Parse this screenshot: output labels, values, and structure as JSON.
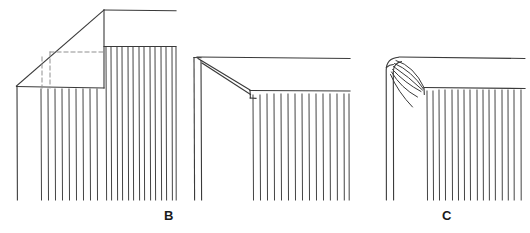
{
  "plate": {
    "title": "Curtain heading corner treatments",
    "background_color": "#ffffff",
    "line_color": "#3a3a3a",
    "dash_color": "#8c8c8c",
    "width": 530,
    "height": 233
  },
  "labels": [
    {
      "id": "b",
      "text": "B",
      "x": 164,
      "y": 209
    },
    {
      "id": "c",
      "text": "C",
      "x": 442,
      "y": 209
    }
  ],
  "figures": [
    {
      "id": "a",
      "name": "mitred-corner-with-hidden-construction",
      "label": null,
      "description": "Corner with straight diagonal return, dashed hidden lines showing inner fold, and vertical gathered fabric hatching below.",
      "parts": {
        "top_rail": {
          "from": [
            104,
            10
          ],
          "to": [
            176,
            11
          ]
        },
        "diagonal": {
          "from": [
            16,
            86
          ],
          "to": [
            104,
            10
          ]
        },
        "vertical_post_right": {
          "from": [
            104,
            10
          ],
          "to": [
            104,
            88
          ]
        },
        "bottom_ledge": {
          "from": [
            16,
            86
          ],
          "to": [
            104,
            88
          ]
        },
        "left_vertical": {
          "from": [
            17,
            86
          ],
          "to": [
            17,
            200
          ]
        },
        "panel_top_edge": {
          "from": [
            104,
            46
          ],
          "to": [
            176,
            46
          ]
        },
        "dashed_vertical_inner": {
          "from": [
            42,
            56
          ],
          "to": [
            42,
            88
          ]
        },
        "dashed_vertical_outer": {
          "from": [
            50,
            52
          ],
          "to": [
            50,
            88
          ]
        },
        "dashed_horizontal": {
          "from": [
            50,
            52
          ],
          "to": [
            104,
            52
          ]
        }
      },
      "hatch": {
        "count_inner": 9,
        "inner_x_range": [
          41,
          102
        ],
        "inner_y_range": [
          88,
          200
        ],
        "count_outer": 14,
        "outer_x_range": [
          104,
          176
        ],
        "outer_y_range": [
          46,
          200
        ]
      }
    },
    {
      "id": "b",
      "name": "double-line-diagonal-corner",
      "label": "B",
      "description": "Corner with doubled diagonal band from top post down to panel top, double vertical post at left, vertical gathered hatching in panel.",
      "parts": {
        "top_rail": {
          "from": [
            198,
            57
          ],
          "to": [
            350,
            58
          ]
        },
        "post_outer": {
          "from": [
            194,
            57
          ],
          "to": [
            194,
            200
          ]
        },
        "post_inner": {
          "from": [
            201,
            60
          ],
          "to": [
            201,
            200
          ]
        },
        "diagonal_upper": {
          "from": [
            198,
            58
          ],
          "to": [
            250,
            90
          ]
        },
        "diagonal_lower": {
          "from": [
            202,
            63
          ],
          "to": [
            250,
            95
          ]
        },
        "panel_top_edge": {
          "from": [
            250,
            92
          ],
          "to": [
            350,
            92
          ]
        },
        "panel_left_step": {
          "from": [
            250,
            90
          ],
          "to": [
            250,
            98
          ]
        }
      },
      "hatch": {
        "count": 15,
        "x_range": [
          253,
          349
        ],
        "y_range": [
          95,
          200
        ]
      }
    },
    {
      "id": "c",
      "name": "fan-pleated-rounded-corner",
      "label": "C",
      "description": "Rounded corner with fan of curved pleat lines radiating from the top corner down to the panel top, double vertical post at left, vertical gathered hatching in panel.",
      "parts": {
        "top_rail": {
          "from": [
            396,
            57
          ],
          "to": [
            525,
            58
          ]
        },
        "post_outer": {
          "from": [
            386,
            66
          ],
          "to": [
            388,
            200
          ]
        },
        "post_inner": {
          "from": [
            393,
            68
          ],
          "to": [
            395,
            200
          ]
        },
        "corner_round": "arc from (386,66) to (398,57)",
        "panel_top_edge": {
          "from": [
            424,
            88
          ],
          "to": [
            525,
            88
          ]
        }
      },
      "fan_lines": 6,
      "hatch": {
        "count": 16,
        "x_range": [
          427,
          524
        ],
        "y_range": [
          91,
          200
        ]
      }
    }
  ]
}
